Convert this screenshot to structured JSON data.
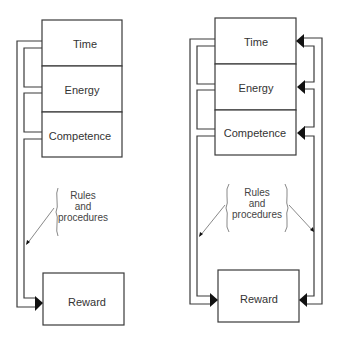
{
  "diagrams": {
    "left": {
      "inputs": [
        {
          "label": "Time"
        },
        {
          "label": "Energy"
        },
        {
          "label": "Competence"
        }
      ],
      "annotation": {
        "line1": "Rules",
        "line2": "and",
        "line3": "procedures"
      },
      "output": {
        "label": "Reward"
      },
      "feedback": false
    },
    "right": {
      "inputs": [
        {
          "label": "Time"
        },
        {
          "label": "Energy"
        },
        {
          "label": "Competence"
        }
      ],
      "annotation": {
        "line1": "Rules",
        "line2": "and",
        "line3": "procedures"
      },
      "output": {
        "label": "Reward"
      },
      "feedback": true
    }
  },
  "colors": {
    "stroke": "#3a3a3a",
    "arrow": "#111111",
    "text": "#333333",
    "background": "#ffffff"
  }
}
